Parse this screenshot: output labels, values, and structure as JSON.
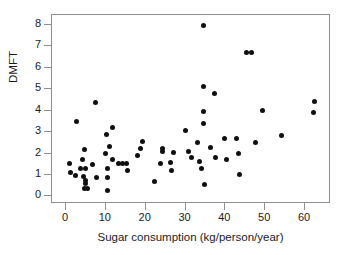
{
  "chart_data": {
    "type": "scatter",
    "title": "",
    "xlabel": "Sugar consumption (kg/person/year)",
    "ylabel": "DMFT",
    "xlim": [
      -3.5,
      66.5
    ],
    "ylim": [
      -0.35,
      8.45
    ],
    "xticks": [
      0,
      10,
      20,
      30,
      40,
      50,
      60
    ],
    "yticks": [
      0,
      1,
      2,
      3,
      4,
      5,
      6,
      7,
      8
    ],
    "grid": false,
    "legend": null,
    "marker": "filled-circle",
    "marker_color": "#101010",
    "points": [
      {
        "x": 1.0,
        "y": 1.55
      },
      {
        "x": 1.2,
        "y": 1.1
      },
      {
        "x": 2.3,
        "y": 0.98
      },
      {
        "x": 2.6,
        "y": 3.48
      },
      {
        "x": 3.6,
        "y": 1.3
      },
      {
        "x": 4.2,
        "y": 1.72
      },
      {
        "x": 4.5,
        "y": 0.95
      },
      {
        "x": 4.6,
        "y": 2.18
      },
      {
        "x": 4.8,
        "y": 1.32
      },
      {
        "x": 4.9,
        "y": 0.75
      },
      {
        "x": 5.0,
        "y": 0.62
      },
      {
        "x": 4.7,
        "y": 0.38
      },
      {
        "x": 5.3,
        "y": 0.35
      },
      {
        "x": 6.6,
        "y": 1.5
      },
      {
        "x": 7.5,
        "y": 4.38
      },
      {
        "x": 7.7,
        "y": 0.9
      },
      {
        "x": 9.8,
        "y": 2.02
      },
      {
        "x": 10.2,
        "y": 2.9
      },
      {
        "x": 10.4,
        "y": 1.28
      },
      {
        "x": 10.3,
        "y": 0.88
      },
      {
        "x": 10.3,
        "y": 0.3
      },
      {
        "x": 11.0,
        "y": 2.32
      },
      {
        "x": 11.6,
        "y": 3.2
      },
      {
        "x": 11.8,
        "y": 1.72
      },
      {
        "x": 13.3,
        "y": 1.52
      },
      {
        "x": 14.1,
        "y": 1.55
      },
      {
        "x": 15.2,
        "y": 1.55
      },
      {
        "x": 15.5,
        "y": 1.2
      },
      {
        "x": 17.9,
        "y": 1.9
      },
      {
        "x": 18.6,
        "y": 2.25
      },
      {
        "x": 19.2,
        "y": 2.55
      },
      {
        "x": 22.2,
        "y": 0.72
      },
      {
        "x": 23.6,
        "y": 1.55
      },
      {
        "x": 24.1,
        "y": 2.22
      },
      {
        "x": 24.3,
        "y": 2.08
      },
      {
        "x": 26.2,
        "y": 1.6
      },
      {
        "x": 26.4,
        "y": 1.2
      },
      {
        "x": 27.1,
        "y": 2.06
      },
      {
        "x": 29.9,
        "y": 3.08
      },
      {
        "x": 30.8,
        "y": 2.08
      },
      {
        "x": 31.4,
        "y": 1.8
      },
      {
        "x": 33.0,
        "y": 2.5
      },
      {
        "x": 33.5,
        "y": 1.62
      },
      {
        "x": 34.0,
        "y": 1.28
      },
      {
        "x": 34.4,
        "y": 5.12
      },
      {
        "x": 34.5,
        "y": 7.95
      },
      {
        "x": 34.6,
        "y": 3.94
      },
      {
        "x": 34.4,
        "y": 3.38
      },
      {
        "x": 34.8,
        "y": 0.54
      },
      {
        "x": 36.2,
        "y": 2.28
      },
      {
        "x": 37.2,
        "y": 4.78
      },
      {
        "x": 37.4,
        "y": 1.82
      },
      {
        "x": 39.7,
        "y": 2.72
      },
      {
        "x": 40.2,
        "y": 1.7
      },
      {
        "x": 42.8,
        "y": 2.72
      },
      {
        "x": 43.3,
        "y": 2.02
      },
      {
        "x": 43.6,
        "y": 1.02
      },
      {
        "x": 45.4,
        "y": 6.7
      },
      {
        "x": 46.5,
        "y": 6.7
      },
      {
        "x": 47.5,
        "y": 2.52
      },
      {
        "x": 49.2,
        "y": 4.02
      },
      {
        "x": 54.0,
        "y": 2.82
      },
      {
        "x": 62.3,
        "y": 4.42
      },
      {
        "x": 62.1,
        "y": 3.92
      }
    ]
  },
  "axes": {
    "x_tick_labels": [
      "0",
      "10",
      "20",
      "30",
      "40",
      "50",
      "60"
    ],
    "y_tick_labels": [
      "0",
      "1",
      "2",
      "3",
      "4",
      "5",
      "6",
      "7",
      "8"
    ]
  }
}
